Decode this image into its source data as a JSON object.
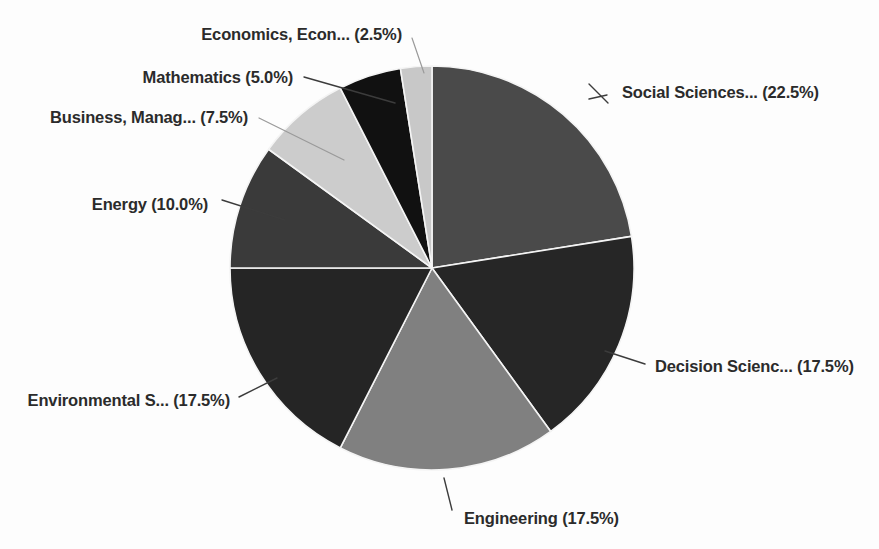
{
  "chart_data": {
    "type": "pie",
    "title": "",
    "subtitle": "",
    "xlabel": "",
    "ylabel": "",
    "legend_position": "none",
    "grid": false,
    "start_angle_deg": 0,
    "direction": "clockwise",
    "categories": [
      "Social Sciences...",
      "Decision Scienc...",
      "Engineering",
      "Environmental S...",
      "Energy",
      "Business, Manag...",
      "Mathematics",
      "Economics, Econ..."
    ],
    "values": [
      22.5,
      17.5,
      17.5,
      17.5,
      10.0,
      7.5,
      5.0,
      2.5
    ],
    "value_unit": "%",
    "colors": [
      "#4a4a4a",
      "#262626",
      "#808080",
      "#252525",
      "#3a3a3a",
      "#cccccc",
      "#111111",
      "#c8c8c8"
    ],
    "annotations": [
      "Social Sciences... (22.5%)",
      "Decision Scienc... (17.5%)",
      "Engineering (17.5%)",
      "Environmental S... (17.5%)",
      "Energy (10.0%)",
      "Business, Manag... (7.5%)",
      "Mathematics (5.0%)",
      "Economics, Econ... (2.5%)"
    ]
  },
  "labels": {
    "social_sciences": "Social Sciences... (22.5%)",
    "decision_sciences": "Decision Scienc... (17.5%)",
    "engineering": "Engineering (17.5%)",
    "environmental_sciences": "Environmental S... (17.5%)",
    "energy": "Energy (10.0%)",
    "business_management": "Business, Manag... (7.5%)",
    "mathematics": "Mathematics (5.0%)",
    "economics": "Economics, Econ... (2.5%)"
  },
  "colors": {
    "background": "#fdfdfd",
    "label_text": "#2b2b2b",
    "slice_border": "#f4f4f4",
    "leader_line": "#3c3c3c"
  }
}
